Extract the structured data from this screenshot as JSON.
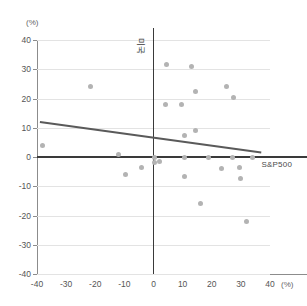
{
  "chart_data": {
    "type": "scatter",
    "title": "",
    "xlabel": "(%)",
    "ylabel": "(%)",
    "xlim": [
      -40,
      40
    ],
    "ylim": [
      -40,
      40
    ],
    "grid": true,
    "x_ticks": [
      "-40",
      "-30",
      "-20",
      "-10",
      "0",
      "10",
      "20",
      "30",
      "40"
    ],
    "y_ticks": [
      "40",
      "30",
      "20",
      "10",
      "0",
      "-10",
      "-20",
      "-30",
      "-40"
    ],
    "x_unit": "(%)",
    "y_unit": "(%)",
    "points": [
      {
        "x": -38.0,
        "y": 4.0
      },
      {
        "x": -21.5,
        "y": 24.0
      },
      {
        "x": -12.0,
        "y": 1.0
      },
      {
        "x": -9.5,
        "y": -6.0
      },
      {
        "x": -4.0,
        "y": -3.5
      },
      {
        "x": 0.5,
        "y": 0.0
      },
      {
        "x": 0.5,
        "y": -2.0
      },
      {
        "x": 2.0,
        "y": -1.5
      },
      {
        "x": 4.5,
        "y": 31.5
      },
      {
        "x": 4.0,
        "y": 18.0
      },
      {
        "x": 9.5,
        "y": 18.0
      },
      {
        "x": 10.5,
        "y": 7.5
      },
      {
        "x": 10.5,
        "y": -6.5
      },
      {
        "x": 13.0,
        "y": 31.0
      },
      {
        "x": 14.5,
        "y": 9.0
      },
      {
        "x": 14.5,
        "y": 22.5
      },
      {
        "x": 16.0,
        "y": -16.0
      },
      {
        "x": 10.5,
        "y": 0.0
      },
      {
        "x": 19.0,
        "y": 0.0
      },
      {
        "x": 23.5,
        "y": -4.0
      },
      {
        "x": 25.0,
        "y": 24.0
      },
      {
        "x": 27.5,
        "y": 20.5
      },
      {
        "x": 27.0,
        "y": 0.0
      },
      {
        "x": 29.5,
        "y": -3.5
      },
      {
        "x": 30.0,
        "y": -7.5
      },
      {
        "x": 32.0,
        "y": -22.0
      },
      {
        "x": 34.0,
        "y": 0.0
      }
    ],
    "trend_line": {
      "x1": -39.0,
      "y1": 12.0,
      "x2": 37.0,
      "y2": 1.5,
      "color": "#5a5a5a"
    },
    "reference_lines": [
      {
        "orientation": "horizontal",
        "value": 0,
        "label": "S&P500",
        "color": "#3a3a3a"
      },
      {
        "orientation": "vertical",
        "value": 0,
        "label": "미국",
        "color": "#3a3a3a"
      }
    ],
    "point_color": "#b3b3b3"
  }
}
